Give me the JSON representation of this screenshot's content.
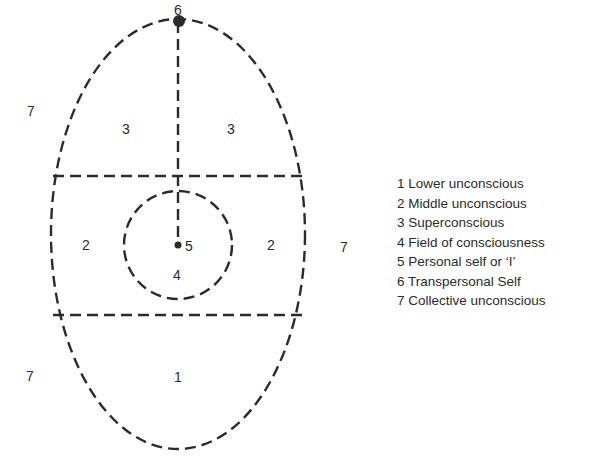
{
  "diagram": {
    "type": "egg-diagram",
    "stroke_color": "#2b2b2b",
    "region_numbers": {
      "transpersonal_self": "6",
      "collective_left_top": "7",
      "collective_right": "7",
      "collective_left_bottom": "7",
      "superconscious_left": "3",
      "superconscious_right": "3",
      "middle_left": "2",
      "middle_right": "2",
      "personal_self": "5",
      "field_of_consciousness": "4",
      "lower": "1"
    }
  },
  "legend": {
    "items": [
      {
        "label": "1 Lower unconscious"
      },
      {
        "label": "2 Middle unconscious"
      },
      {
        "label": "3 Superconscious"
      },
      {
        "label": "4 Field of consciousness"
      },
      {
        "label": "5 Personal self or ‘I’"
      },
      {
        "label": "6 Transpersonal Self"
      },
      {
        "label": "7 Collective unconscious"
      }
    ]
  }
}
